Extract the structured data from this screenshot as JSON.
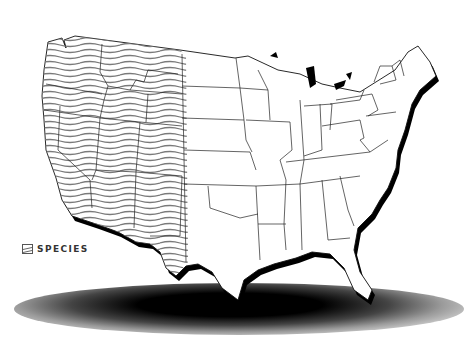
{
  "map": {
    "title": "United States species range map",
    "region_shown": "Contiguous United States",
    "highlighted_states": [
      "Washington",
      "Oregon",
      "Idaho",
      "Montana",
      "Wyoming",
      "California",
      "Nevada",
      "Utah",
      "Colorado",
      "Arizona",
      "New Mexico"
    ],
    "colors": {
      "land": "#ffffff",
      "borders": "#1a1a1a",
      "hatch": "#777777",
      "coast_shadow": "#000000",
      "ground_shadow": "#000000"
    }
  },
  "legend": {
    "items": [
      {
        "icon": "wavy-hatch-swatch",
        "label": "SPECIES"
      }
    ]
  }
}
